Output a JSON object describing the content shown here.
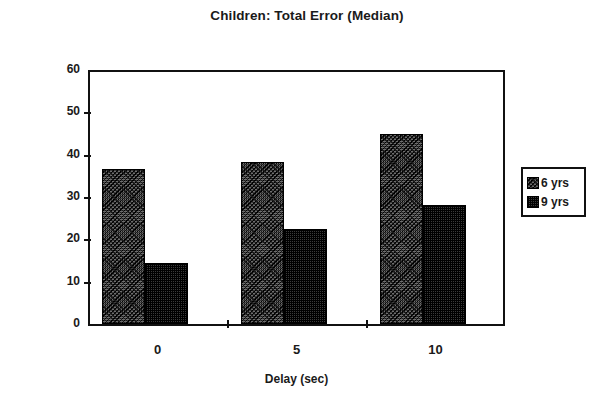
{
  "chart_data": {
    "type": "bar",
    "title": "Children: Total Error (Median)",
    "xlabel": "Delay (sec)",
    "ylabel": "Total Error (mm)",
    "categories": [
      "0",
      "5",
      "10"
    ],
    "series": [
      {
        "name": "6 yrs",
        "values": [
          36.5,
          38.3,
          45.0
        ]
      },
      {
        "name": "9 yrs",
        "values": [
          14.5,
          22.5,
          28.0
        ]
      }
    ],
    "ylim": [
      0,
      60
    ],
    "yticks": [
      0,
      10,
      20,
      30,
      40,
      50,
      60
    ],
    "ytick_labels": [
      "0",
      "10",
      "20",
      "30",
      "40",
      "50",
      "60"
    ],
    "grid": false,
    "legend_position": "right",
    "legend_entries": [
      "6 yrs",
      "9 yrs"
    ],
    "colors": {
      "series_6yrs": "#6e6e6e",
      "series_9yrs": "#3a3a3a",
      "axis": "#111111"
    }
  }
}
